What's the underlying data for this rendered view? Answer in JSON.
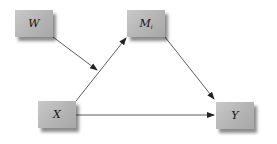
{
  "diagram": {
    "type": "path-diagram (moderated mediation)",
    "nodes": {
      "w": {
        "label": "W"
      },
      "m": {
        "label": "M",
        "subscript": "i"
      },
      "x": {
        "label": "X"
      },
      "y": {
        "label": "Y"
      }
    },
    "edges": [
      {
        "from": "X",
        "to": "M_i"
      },
      {
        "from": "M_i",
        "to": "Y"
      },
      {
        "from": "X",
        "to": "Y"
      },
      {
        "from": "W",
        "to": "X→M_i path"
      }
    ],
    "colors": {
      "node_fill": "#b8b8b8",
      "edge": "#333333",
      "background": "#ffffff"
    }
  }
}
